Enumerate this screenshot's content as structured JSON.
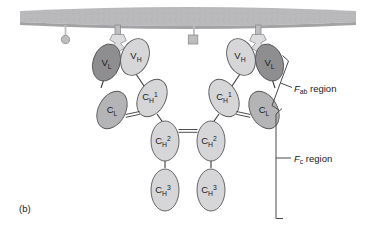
{
  "figure": {
    "panel_label": "(b)"
  },
  "colors": {
    "background": "#ffffff",
    "membrane": "#b9b9bb",
    "membrane_shadow": "#a8a8aa",
    "anchor": "#bdbdbf",
    "v_light": "#8e8e90",
    "c_light": "#b4b4b6",
    "heavy": "#d6d6d8",
    "outline": "#58585a",
    "text": "#1a1a1a",
    "bracket": "#4a4a4a"
  },
  "domains": {
    "left_vl": {
      "label_base": "V",
      "label_sub": "L",
      "label_sup": "",
      "chain": "light",
      "shade": "v_light"
    },
    "left_vh": {
      "label_base": "V",
      "label_sub": "H",
      "label_sup": "",
      "chain": "heavy",
      "shade": "heavy"
    },
    "left_cl": {
      "label_base": "C",
      "label_sub": "L",
      "label_sup": "",
      "chain": "light",
      "shade": "c_light"
    },
    "left_ch1": {
      "label_base": "C",
      "label_sub": "H",
      "label_sup": "1",
      "chain": "heavy",
      "shade": "heavy"
    },
    "right_vl": {
      "label_base": "V",
      "label_sub": "L",
      "label_sup": "",
      "chain": "light",
      "shade": "v_light"
    },
    "right_vh": {
      "label_base": "V",
      "label_sub": "H",
      "label_sup": "",
      "chain": "heavy",
      "shade": "heavy"
    },
    "right_cl": {
      "label_base": "C",
      "label_sub": "L",
      "label_sup": "",
      "chain": "light",
      "shade": "c_light"
    },
    "right_ch1": {
      "label_base": "C",
      "label_sub": "H",
      "label_sup": "1",
      "chain": "heavy",
      "shade": "heavy"
    },
    "left_ch2": {
      "label_base": "C",
      "label_sub": "H",
      "label_sup": "2",
      "chain": "heavy",
      "shade": "heavy"
    },
    "right_ch2": {
      "label_base": "C",
      "label_sub": "H",
      "label_sup": "2",
      "chain": "heavy",
      "shade": "heavy"
    },
    "left_ch3": {
      "label_base": "C",
      "label_sub": "H",
      "label_sup": "3",
      "chain": "heavy",
      "shade": "heavy"
    },
    "right_ch3": {
      "label_base": "C",
      "label_sub": "H",
      "label_sup": "3",
      "chain": "heavy",
      "shade": "heavy"
    }
  },
  "regions": {
    "fab": {
      "italic": "F",
      "sub": "ab",
      "rest": " region"
    },
    "fc": {
      "italic": "F",
      "sub": "c",
      "rest": " region"
    }
  },
  "membrane": {
    "markers": [
      {
        "name": "round-marker",
        "shape": "circle"
      },
      {
        "name": "square-marker",
        "shape": "square"
      },
      {
        "name": "left-anchor",
        "shape": "stalk"
      },
      {
        "name": "right-anchor",
        "shape": "stalk"
      }
    ]
  }
}
